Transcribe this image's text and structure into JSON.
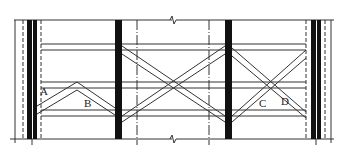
{
  "diagram": {
    "type": "structural bracing elevation",
    "labels": [
      {
        "id": "A",
        "text": "A",
        "x": 40,
        "y": 86
      },
      {
        "id": "B",
        "text": "B",
        "x": 84,
        "y": 98
      },
      {
        "id": "C",
        "text": "C",
        "x": 259,
        "y": 98
      },
      {
        "id": "D",
        "text": "D",
        "x": 281,
        "y": 96
      }
    ],
    "colors": {
      "line": "#333333",
      "column": "#111111",
      "background": "#ffffff"
    }
  }
}
